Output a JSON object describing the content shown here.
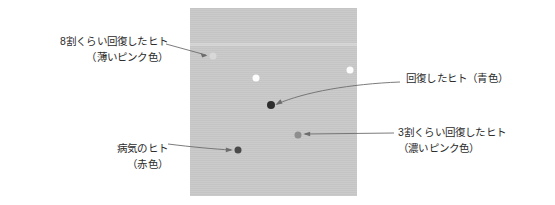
{
  "figure": {
    "panel": {
      "background_color": "#c9c9c9",
      "band_color": "#d6d6d6"
    },
    "dots": [
      {
        "id": "pale-pink-agent",
        "name": "dot-pale-pink",
        "x": 23,
        "y": 48,
        "size": 7,
        "color": "#d8d8d8",
        "described_as": "薄いピンク色"
      },
      {
        "id": "white-agent-center",
        "name": "dot-white-center",
        "x": 66,
        "y": 70,
        "size": 7,
        "color": "#fdfdfd",
        "described_as": "白"
      },
      {
        "id": "white-agent-right",
        "name": "dot-white-right",
        "x": 160,
        "y": 62,
        "size": 7,
        "color": "#fdfdfd",
        "described_as": "白"
      },
      {
        "id": "blue-agent",
        "name": "dot-blue",
        "x": 81,
        "y": 97,
        "size": 8,
        "color": "#2e2e2e",
        "described_as": "青色"
      },
      {
        "id": "deep-pink-agent",
        "name": "dot-deep-pink",
        "x": 108,
        "y": 127,
        "size": 7,
        "color": "#8e8e8e",
        "described_as": "濃いピンク色"
      },
      {
        "id": "red-agent",
        "name": "dot-red",
        "x": 48,
        "y": 142,
        "size": 7,
        "color": "#4a4a4a",
        "described_as": "赤色"
      }
    ],
    "annotations": {
      "pale_pink": {
        "line1": "8割くらい回復したヒト",
        "line2": "（薄いピンク色）"
      },
      "sick": {
        "line1": "病気のヒト",
        "line2": "（赤色）"
      },
      "recovered": {
        "line1": "回復したヒト（青色）",
        "line2": ""
      },
      "deep_pink": {
        "line1": "3割くらい回復したヒト",
        "line2": "（濃いピンク色）"
      }
    },
    "leader_line_color": "#6d6d6d"
  }
}
